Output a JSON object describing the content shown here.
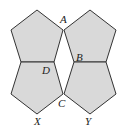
{
  "diagram": {
    "type": "geometry-figure",
    "fill_color": "#d9d9d9",
    "stroke_color": "#333333",
    "pentagons": [
      {
        "id": "top-left",
        "points": "37,10 63,30 54,62 21,62 11,30"
      },
      {
        "id": "top-right",
        "points": "90,10 116,30 106,62 74,62 64,30"
      },
      {
        "id": "bottom-left",
        "points": "21,62 54,62 63,94 37,114 11,94"
      },
      {
        "id": "bottom-right",
        "points": "74,62 106,62 116,94 90,114 64,94"
      }
    ],
    "labels": {
      "A": "A",
      "B": "B",
      "C": "C",
      "D": "D",
      "X": "X",
      "Y": "Y"
    }
  }
}
